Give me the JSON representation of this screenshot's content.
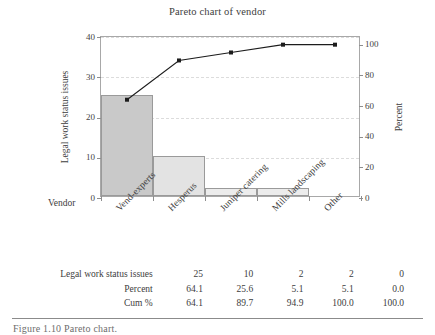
{
  "chart_data": {
    "type": "bar",
    "title": "Pareto chart of vendor",
    "xlabel": "Vendor",
    "ylabel": "Legal work status issues",
    "y2label": "Percent",
    "categories": [
      "Vend-experts",
      "Hesperus",
      "Juniper catering",
      "Mills landscaping",
      "Other"
    ],
    "values": [
      25,
      10,
      2,
      2,
      0
    ],
    "percent": [
      64.1,
      25.6,
      5.1,
      5.1,
      0.0
    ],
    "cum_percent": [
      64.1,
      89.7,
      94.9,
      100.0,
      100.0
    ],
    "ylim": [
      0,
      40
    ],
    "yticks": [
      0,
      10,
      20,
      30,
      40
    ],
    "y2lim": [
      0,
      105
    ],
    "y2ticks": [
      0,
      20,
      40,
      60,
      80,
      100
    ],
    "grid": true,
    "legend": "none",
    "series": [
      {
        "name": "Legal work status issues",
        "type": "bar",
        "values": [
          25,
          10,
          2,
          2,
          0
        ]
      },
      {
        "name": "Cum %",
        "type": "line",
        "values": [
          64.1,
          89.7,
          94.9,
          100.0,
          100.0
        ]
      }
    ],
    "bar_colors": [
      "#c9c9c9",
      "#e3e3e3",
      "#ececec",
      "#ececec",
      "#ececec"
    ],
    "line_color": "#1c1c1c"
  },
  "table": {
    "rows": [
      {
        "label": "Legal work status issues",
        "values": [
          "25",
          "10",
          "2",
          "2",
          "0"
        ]
      },
      {
        "label": "Percent",
        "values": [
          "64.1",
          "25.6",
          "5.1",
          "5.1",
          "0.0"
        ]
      },
      {
        "label": "Cum %",
        "values": [
          "64.1",
          "89.7",
          "94.9",
          "100.0",
          "100.0"
        ]
      }
    ]
  },
  "footer": {
    "caption": "Figure 1.10   Pareto chart."
  }
}
